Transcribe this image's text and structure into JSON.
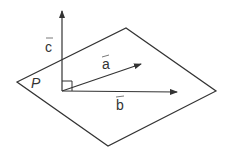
{
  "diagram": {
    "type": "vector-plane-diagram",
    "line_color": "#333333",
    "background": "#ffffff",
    "plane": {
      "label": "P",
      "vertices": {
        "left": [
          17,
          82
        ],
        "top": [
          126,
          28
        ],
        "right": [
          216,
          91
        ],
        "bottom": [
          108,
          146
        ]
      }
    },
    "origin": [
      62,
      91
    ],
    "vectors": [
      {
        "name": "a",
        "label": "a",
        "tip": [
          142,
          64
        ],
        "label_pos": [
          104,
          68
        ]
      },
      {
        "name": "b",
        "label": "b",
        "tip": [
          177,
          93
        ],
        "label_pos": [
          117,
          109
        ]
      },
      {
        "name": "c",
        "label": "c",
        "tip": [
          62,
          10
        ],
        "label_pos": [
          46,
          50
        ]
      }
    ],
    "right_angle_marker": {
      "x": 62,
      "y": 81,
      "size": 10
    }
  }
}
